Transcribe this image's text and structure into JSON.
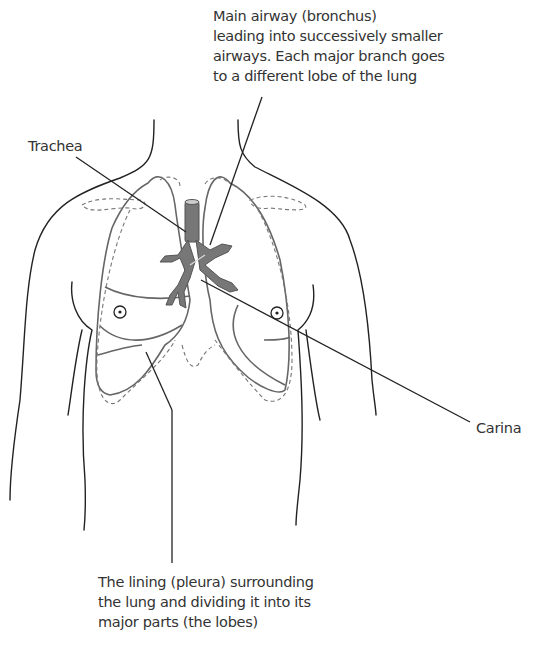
{
  "figure": {
    "labels": {
      "main_airway": [
        "Main airway (bronchus)",
        "leading into successively smaller",
        "airways. Each major branch goes",
        "to a different lobe of the lung"
      ],
      "trachea": "Trachea",
      "carina": "Carina",
      "pleura": [
        "The lining (pleura) surrounding",
        "the lung and dividing it into its",
        "major parts (the lobes)"
      ]
    }
  }
}
